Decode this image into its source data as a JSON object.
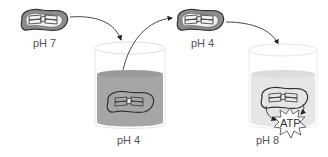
{
  "diagram": {
    "stages": [
      {
        "label": "pH 7",
        "container": "none"
      },
      {
        "label": "pH 4",
        "container": "beaker",
        "liquid": "acidic"
      },
      {
        "label": "pH 4",
        "container": "none"
      },
      {
        "label": "pH 8",
        "container": "beaker",
        "liquid": "basic"
      }
    ],
    "product_label": "ATP",
    "colors": {
      "acidic_liquid": "#a6a6a6",
      "basic_liquid": "#e6e6e6",
      "chloroplast_fill": "#8c8c8c",
      "outline": "#333333",
      "arrow": "#333333"
    }
  }
}
